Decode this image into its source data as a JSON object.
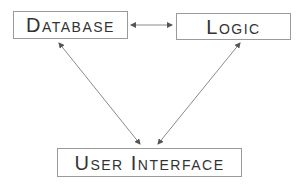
{
  "diagram": {
    "nodes": [
      {
        "id": "database",
        "label": "Database"
      },
      {
        "id": "logic",
        "label": "Logic"
      },
      {
        "id": "user_interface",
        "label": "User Interface"
      }
    ],
    "edges": [
      {
        "from": "database",
        "to": "logic",
        "direction": "bidirectional"
      },
      {
        "from": "database",
        "to": "user_interface",
        "direction": "bidirectional"
      },
      {
        "from": "logic",
        "to": "user_interface",
        "direction": "bidirectional"
      }
    ],
    "colors": {
      "stroke": "#8a8a8a",
      "text": "#333333"
    }
  }
}
